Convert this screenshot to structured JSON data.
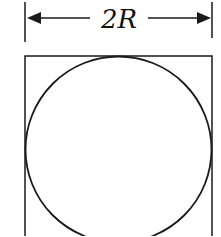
{
  "diagram": {
    "dimension_label": "2R",
    "colors": {
      "stroke": "#1a1a1a",
      "background": "#ffffff"
    }
  }
}
